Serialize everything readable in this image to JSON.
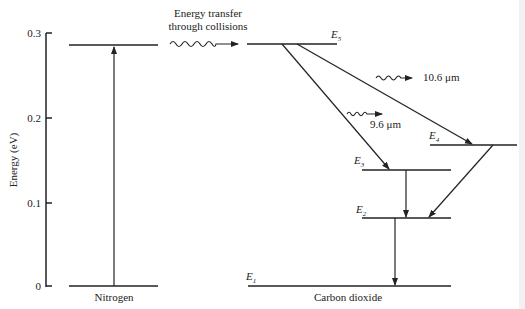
{
  "axis": {
    "label": "Energy (eV)",
    "ticks": [
      "0.3",
      "0.2",
      "0.1",
      "0"
    ]
  },
  "nitrogen": {
    "label": "Nitrogen"
  },
  "transfer": {
    "line1": "Energy transfer",
    "line2": "through collisions"
  },
  "co2": {
    "label": "Carbon dioxide",
    "levels": [
      {
        "name": "E",
        "sub": "5"
      },
      {
        "name": "E",
        "sub": "4"
      },
      {
        "name": "E",
        "sub": "3"
      },
      {
        "name": "E",
        "sub": "2"
      },
      {
        "name": "E",
        "sub": "1"
      }
    ]
  },
  "emissions": {
    "long": "10.6 μm",
    "short": "9.6 μm"
  }
}
